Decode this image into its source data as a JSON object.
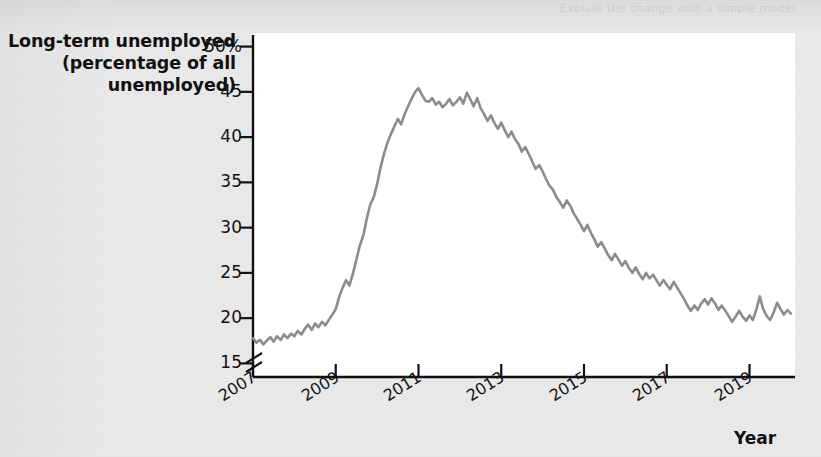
{
  "figure": {
    "background_color": "#e9e9e9",
    "plot_background_color": "#ffffff",
    "axis_color": "#111111",
    "line_color": "#8c8c8c",
    "ghost_text_line_1": "Explain the change with a simple model",
    "ghost_text_line_2": "unemployment in the labor market"
  },
  "chart_data": {
    "type": "line",
    "title": "",
    "ylabel": "Long-term unemployed (percentage of all unemployed)",
    "ylabel_lines": [
      "Long-term unemployed",
      "(percentage of all",
      "unemployed)"
    ],
    "xlabel": "Year",
    "ylim": [
      13.5,
      51.5
    ],
    "yticks": [
      15,
      20,
      25,
      30,
      35,
      40,
      45,
      50
    ],
    "ytick_labels": [
      "15",
      "20",
      "25",
      "30",
      "35",
      "40",
      "45",
      "50%"
    ],
    "y_axis_break": true,
    "xlim": [
      2007.0,
      2020.1
    ],
    "xticks": [
      2007,
      2009,
      2011,
      2013,
      2015,
      2017,
      2019
    ],
    "xtick_labels": [
      "2007",
      "2009",
      "2011",
      "2013",
      "2015",
      "2017",
      "2019"
    ],
    "xtick_rotation_degrees": -32,
    "grid": false,
    "legend": null,
    "series": [
      {
        "name": "Long-term unemployed share",
        "color": "#8c8c8c",
        "line_width": 2.6,
        "x": [
          2007.0,
          2007.08,
          2007.17,
          2007.25,
          2007.33,
          2007.42,
          2007.5,
          2007.58,
          2007.67,
          2007.75,
          2007.83,
          2007.92,
          2008.0,
          2008.08,
          2008.17,
          2008.25,
          2008.33,
          2008.42,
          2008.5,
          2008.58,
          2008.67,
          2008.75,
          2008.83,
          2008.92,
          2009.0,
          2009.08,
          2009.17,
          2009.25,
          2009.33,
          2009.42,
          2009.5,
          2009.58,
          2009.67,
          2009.75,
          2009.83,
          2009.92,
          2010.0,
          2010.08,
          2010.17,
          2010.25,
          2010.33,
          2010.42,
          2010.5,
          2010.58,
          2010.67,
          2010.75,
          2010.83,
          2010.92,
          2011.0,
          2011.08,
          2011.17,
          2011.25,
          2011.33,
          2011.42,
          2011.5,
          2011.58,
          2011.67,
          2011.75,
          2011.83,
          2011.92,
          2012.0,
          2012.08,
          2012.17,
          2012.25,
          2012.33,
          2012.42,
          2012.5,
          2012.58,
          2012.67,
          2012.75,
          2012.83,
          2012.92,
          2013.0,
          2013.08,
          2013.17,
          2013.25,
          2013.33,
          2013.42,
          2013.5,
          2013.58,
          2013.67,
          2013.75,
          2013.83,
          2013.92,
          2014.0,
          2014.08,
          2014.17,
          2014.25,
          2014.33,
          2014.42,
          2014.5,
          2014.58,
          2014.67,
          2014.75,
          2014.83,
          2014.92,
          2015.0,
          2015.08,
          2015.17,
          2015.25,
          2015.33,
          2015.42,
          2015.5,
          2015.58,
          2015.67,
          2015.75,
          2015.83,
          2015.92,
          2016.0,
          2016.08,
          2016.17,
          2016.25,
          2016.33,
          2016.42,
          2016.5,
          2016.58,
          2016.67,
          2016.75,
          2016.83,
          2016.92,
          2017.0,
          2017.08,
          2017.17,
          2017.25,
          2017.33,
          2017.42,
          2017.5,
          2017.58,
          2017.67,
          2017.75,
          2017.83,
          2017.92,
          2018.0,
          2018.08,
          2018.17,
          2018.25,
          2018.33,
          2018.42,
          2018.5,
          2018.58,
          2018.67,
          2018.75,
          2018.83,
          2018.92,
          2019.0,
          2019.08,
          2019.17,
          2019.25,
          2019.33,
          2019.42,
          2019.5,
          2019.58,
          2019.67,
          2019.75,
          2019.83,
          2019.92,
          2020.0
        ],
        "y": [
          17.8,
          17.3,
          17.6,
          17.1,
          17.5,
          17.9,
          17.4,
          18.0,
          17.6,
          18.2,
          17.8,
          18.3,
          18.0,
          18.6,
          18.2,
          18.8,
          19.3,
          18.7,
          19.4,
          19.0,
          19.6,
          19.2,
          19.8,
          20.4,
          21.0,
          22.3,
          23.4,
          24.2,
          23.6,
          25.0,
          26.5,
          28.0,
          29.2,
          31.0,
          32.5,
          33.4,
          34.8,
          36.6,
          38.2,
          39.4,
          40.3,
          41.2,
          42.0,
          41.4,
          42.6,
          43.4,
          44.2,
          45.0,
          45.4,
          44.7,
          44.0,
          43.9,
          44.3,
          43.6,
          43.9,
          43.3,
          43.7,
          44.2,
          43.5,
          43.9,
          44.4,
          43.7,
          44.9,
          44.2,
          43.4,
          44.3,
          43.2,
          42.6,
          41.8,
          42.4,
          41.6,
          40.9,
          41.6,
          40.8,
          40.0,
          40.6,
          39.8,
          39.2,
          38.4,
          38.9,
          38.1,
          37.3,
          36.5,
          36.9,
          36.2,
          35.4,
          34.6,
          34.2,
          33.4,
          32.8,
          32.2,
          33.0,
          32.4,
          31.6,
          31.0,
          30.3,
          29.6,
          30.3,
          29.4,
          28.7,
          27.9,
          28.4,
          27.7,
          27.0,
          26.4,
          27.1,
          26.5,
          25.8,
          26.3,
          25.6,
          25.0,
          25.6,
          24.9,
          24.3,
          25.0,
          24.4,
          24.8,
          24.2,
          23.6,
          24.2,
          23.7,
          23.2,
          24.0,
          23.4,
          22.8,
          22.1,
          21.4,
          20.8,
          21.4,
          20.9,
          21.6,
          22.1,
          21.5,
          22.2,
          21.6,
          20.9,
          21.4,
          20.8,
          20.2,
          19.6,
          20.2,
          20.8,
          20.2,
          19.7,
          20.3,
          19.8,
          21.0,
          22.4,
          21.0,
          20.2,
          19.8,
          20.6,
          21.7,
          21.0,
          20.4,
          20.9,
          20.5
        ]
      }
    ]
  }
}
